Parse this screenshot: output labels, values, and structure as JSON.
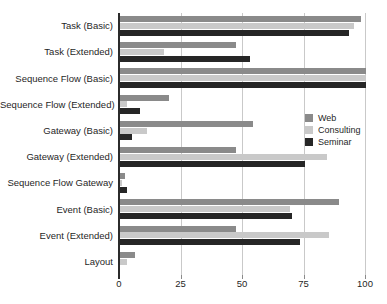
{
  "figure": {
    "background": "#ffffff",
    "text_color": "#1f1f1f",
    "gridline_color": "#c9c9c9",
    "axis_color": "#2b2b2b"
  },
  "chart_data": {
    "type": "bar",
    "orientation": "horizontal",
    "title": "",
    "xlabel": "",
    "ylabel": "",
    "xlim": [
      0,
      100
    ],
    "xticks": [
      0,
      25,
      50,
      75,
      100
    ],
    "grid": true,
    "legend_position": "middle-right",
    "categories": [
      "Task (Basic)",
      "Task (Extended)",
      "Sequence Flow (Basic)",
      "Sequence Flow (Extended)",
      "Gateway (Basic)",
      "Gateway (Extended)",
      "Sequence Flow Gateway",
      "Event (Basic)",
      "Event (Extended)",
      "Layout"
    ],
    "series": [
      {
        "name": "Web",
        "color": "#8a8a8a",
        "values": [
          98,
          47,
          100,
          20,
          54,
          47,
          2,
          89,
          47,
          6
        ]
      },
      {
        "name": "Consulting",
        "color": "#c9c9c9",
        "values": [
          95,
          18,
          100,
          3,
          11,
          84,
          1,
          69,
          85,
          3
        ]
      },
      {
        "name": "Seminar",
        "color": "#262626",
        "values": [
          93,
          53,
          100,
          8,
          5,
          75,
          3,
          70,
          73,
          0
        ]
      }
    ]
  }
}
